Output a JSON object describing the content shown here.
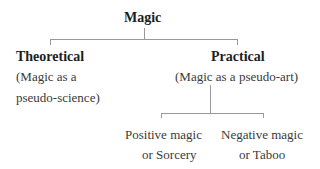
{
  "diagram": {
    "root": {
      "label": "Magic"
    },
    "branches": [
      {
        "title": "Theoretical",
        "subtitle_line1": "(Magic as a",
        "subtitle_line2": "pseudo-science)"
      },
      {
        "title": "Practical",
        "subtitle_line1": "(Magic as a pseudo-art)",
        "children": [
          {
            "line1": "Positive magic",
            "line2": "or Sorcery"
          },
          {
            "line1": "Negative magic",
            "line2": "or Taboo"
          }
        ]
      }
    ],
    "colors": {
      "text": "#2a2a2a",
      "connector": "#9a9a9a",
      "background": "#ffffff"
    }
  }
}
